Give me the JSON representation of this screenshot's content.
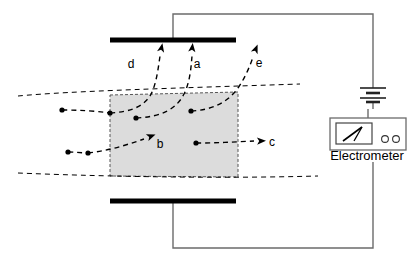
{
  "figure": {
    "title_visible": false,
    "background_color": "#ffffff",
    "line_color": "#000000",
    "wire_color": "#6b6b6b",
    "field_region_fill": "#dcdcdc",
    "field_region_stroke": "#555555",
    "plate_color": "#000000"
  },
  "capacitor": {
    "top_plate": {
      "name": "top-plate",
      "x1": 110,
      "y1": 40,
      "x2": 236,
      "y2": 40,
      "thickness": 5
    },
    "bottom_plate": {
      "name": "bottom-plate",
      "x1": 110,
      "y1": 201,
      "x2": 236,
      "y2": 201,
      "thickness": 5
    }
  },
  "field_region": {
    "name": "shaded-field-region",
    "points": "110,95 238,92 238,177 110,176",
    "fill": "#dcdcdc",
    "stroke": "#555555",
    "dash": "3,2"
  },
  "beam_boundaries": [
    {
      "name": "upper-beam-boundary",
      "d": "M 18,96 C 70,91 180,88 300,84"
    },
    {
      "name": "lower-beam-boundary",
      "d": "M 18,173 C 90,176 210,179 318,176"
    }
  ],
  "trajectories": [
    {
      "id": "d",
      "name": "trajectory-d",
      "label": "d",
      "label_x": 131,
      "label_y": 68,
      "path": "M 110,113 C 128,112 142,108 150,96 C 156,86 158,70 160,56",
      "arrow_at": {
        "x": 161,
        "y": 50,
        "angle": -78
      },
      "start_dot": {
        "x": 110,
        "y": 113
      },
      "deflection": "upward"
    },
    {
      "id": "a",
      "name": "trajectory-a",
      "label": "a",
      "label_x": 197,
      "label_y": 68,
      "path": "M 136,118 C 160,117 176,110 184,94 C 190,82 191,68 192,56",
      "arrow_at": {
        "x": 192,
        "y": 50,
        "angle": -84
      },
      "start_dot": {
        "x": 136,
        "y": 118
      },
      "deflection": "upward"
    },
    {
      "id": "e",
      "name": "trajectory-e",
      "label": "e",
      "label_x": 259,
      "label_y": 67,
      "path": "M 191,111 C 213,110 228,102 238,88 C 245,78 250,66 253,57",
      "arrow_at": {
        "x": 255,
        "y": 51,
        "angle": -68
      },
      "start_dot": {
        "x": 191,
        "y": 111
      },
      "deflection": "upward"
    },
    {
      "id": "b",
      "name": "trajectory-b",
      "label": "b",
      "label_x": 160,
      "label_y": 148,
      "path": "M 88,153 C 106,151 124,146 144,139",
      "arrow_at": {
        "x": 149,
        "y": 137,
        "angle": -21
      },
      "start_dot": {
        "x": 88,
        "y": 153
      },
      "deflection": "straight"
    },
    {
      "id": "c",
      "name": "trajectory-c",
      "label": "c",
      "label_x": 272,
      "label_y": 146,
      "path": "M 196,143 C 216,143 234,142 254,141",
      "arrow_at": {
        "x": 259,
        "y": 141,
        "angle": -2
      },
      "start_dot": {
        "x": 196,
        "y": 143
      },
      "deflection": "straight"
    }
  ],
  "free_particles": [
    {
      "name": "particle-dot-left-upper",
      "x": 62,
      "y": 110
    },
    {
      "name": "particle-dot-left-lower",
      "x": 68,
      "y": 152
    }
  ],
  "entry_stubs": [
    {
      "name": "entry-stub-upper",
      "d": "M 62,110 C 80,110 96,111 110,113"
    },
    {
      "name": "entry-stub-lower",
      "d": "M 68,152 C 76,152 82,153 88,153"
    }
  ],
  "circuit": {
    "top_wire": {
      "name": "top-circuit-wire",
      "d": "M 173,40 L 173,14 L 373,14 L 373,80"
    },
    "bottom_wire": {
      "name": "bottom-circuit-wire",
      "d": "M 173,201 L 173,248 L 373,248 L 373,162"
    },
    "battery": {
      "name": "battery",
      "center_x": 373,
      "top_y": 80,
      "bottom_y": 109,
      "plates": [
        {
          "name": "battery-long-plate-1",
          "y": 88,
          "half_width": 13,
          "thickness": 1.6
        },
        {
          "name": "battery-short-plate-1",
          "y": 93,
          "half_width": 7,
          "thickness": 2.6
        },
        {
          "name": "battery-long-plate-2",
          "y": 98,
          "half_width": 13,
          "thickness": 1.6
        },
        {
          "name": "battery-short-plate-2",
          "y": 102,
          "half_width": 7,
          "thickness": 2.6
        }
      ]
    },
    "electrometer": {
      "name": "electrometer",
      "label": "Electrometer",
      "label_x": 367,
      "label_y": 160,
      "box": {
        "x": 330,
        "y": 118,
        "width": 76,
        "height": 32
      },
      "meter_face": {
        "x": 336,
        "y": 123,
        "width": 36,
        "height": 21
      },
      "needle": {
        "x1": 343,
        "y1": 141,
        "x2": 362,
        "y2": 127
      },
      "needle_tail": {
        "x1": 354,
        "y1": 141,
        "x2": 362,
        "y2": 127
      },
      "knobs": [
        {
          "name": "electrometer-knob-left",
          "cx": 385,
          "cy": 139,
          "r": 3.4
        },
        {
          "name": "electrometer-knob-right",
          "cx": 396,
          "cy": 139,
          "r": 3.4
        }
      ],
      "lead": {
        "name": "electrometer-lead",
        "d": "M 368,118 L 368,109"
      }
    }
  }
}
